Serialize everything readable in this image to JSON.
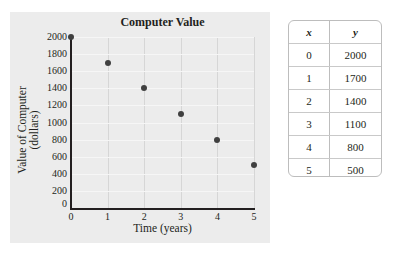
{
  "chart_data": {
    "type": "scatter",
    "title": "Computer Value",
    "xlabel": "Time (years)",
    "ylabel": "Value of Computer (dollars)",
    "x": [
      0,
      1,
      2,
      3,
      4,
      5
    ],
    "y": [
      2000,
      1700,
      1400,
      1100,
      800,
      500
    ],
    "xlim": [
      0,
      5
    ],
    "ylim": [
      0,
      2000
    ],
    "xticks": [
      "0",
      "1",
      "2",
      "3",
      "4",
      "5"
    ],
    "yticks": [
      "0",
      "200",
      "400",
      "600",
      "800",
      "1000",
      "1200",
      "1400",
      "1600",
      "1800",
      "2000"
    ],
    "grid": true,
    "legend": null
  },
  "chart": {
    "title": "Computer Value",
    "ylabel_line1": "Value of Computer",
    "ylabel_line2": "(dollars)",
    "xlabel": "Time (years)",
    "xticks": [
      "0",
      "1",
      "2",
      "3",
      "4",
      "5"
    ],
    "yticks": [
      "0",
      "200",
      "400",
      "600",
      "800",
      "1000",
      "1200",
      "1400",
      "1600",
      "1800",
      "2000"
    ]
  },
  "table": {
    "headers": [
      "x",
      "y"
    ],
    "rows": [
      [
        "0",
        "2000"
      ],
      [
        "1",
        "1700"
      ],
      [
        "2",
        "1400"
      ],
      [
        "3",
        "1100"
      ],
      [
        "4",
        "800"
      ],
      [
        "5",
        "500"
      ]
    ]
  }
}
